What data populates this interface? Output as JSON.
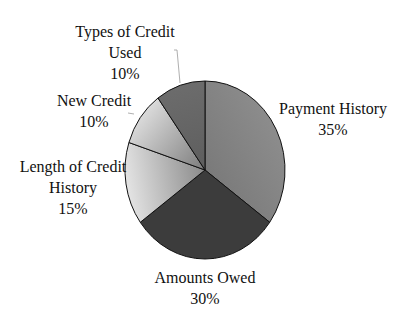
{
  "chart_data": {
    "type": "pie",
    "title": "",
    "start_angle": "12 o'clock",
    "direction": "clockwise",
    "slices": [
      {
        "label": "Payment History",
        "value": 35,
        "value_label": "35%",
        "color": "#7a7a7a",
        "gradient_to": "#8c8c8c"
      },
      {
        "label": "Amounts Owed",
        "value": 30,
        "value_label": "30%",
        "color": "#3c3c3c",
        "gradient_to": "#3c3c3c"
      },
      {
        "label": "Length of Credit History",
        "value": 15,
        "value_label": "15%",
        "color": "#8a8a8a",
        "gradient_to": "#e4e4e4"
      },
      {
        "label": "New Credit",
        "value": 10,
        "value_label": "10%",
        "color": "#7c7c7c",
        "gradient_to": "#dadada"
      },
      {
        "label": "Types of Credit Used",
        "value": 10,
        "value_label": "10%",
        "color": "#5e5e5e",
        "gradient_to": "#6c6c6c"
      }
    ],
    "label_lines": {
      "Payment History": [
        "Payment History",
        "35%"
      ],
      "Amounts Owed": [
        "Amounts Owed",
        "30%"
      ],
      "Length of Credit History": [
        "Length of Credit",
        "History",
        "15%"
      ],
      "New Credit": [
        "New Credit",
        "10%"
      ],
      "Types of Credit Used": [
        "Types of Credit",
        "Used",
        "10%"
      ]
    },
    "legend": "none",
    "units": "percent"
  }
}
